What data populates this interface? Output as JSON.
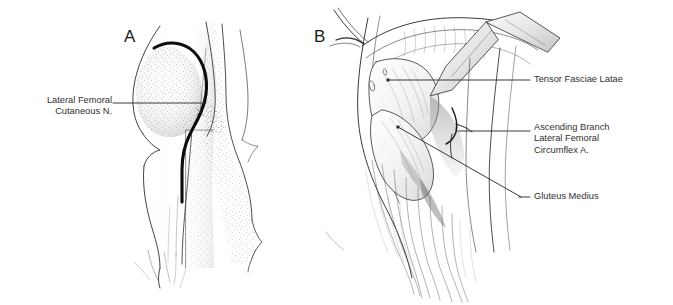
{
  "figure": {
    "type": "anatomical-illustration",
    "panel_count": 2,
    "background_color": "#ffffff",
    "ink_color": "#303030",
    "width": 673,
    "height": 305
  },
  "panels": [
    {
      "letter": "A",
      "description": "Lateral view of hip and thigh surface anatomy with stippled shading and a bold curved line marking the course of the lateral femoral cutaneous nerve / planned incision"
    },
    {
      "letter": "B",
      "description": "Close-up surgical exposure of the hip with retractors, showing the interval between tensor fasciae latae and gluteus medius and the ascending branch of the lateral femoral circumflex artery"
    }
  ],
  "labels": {
    "lateral_femoral_cutaneous_nerve": "Lateral Femoral\nCutaneous N.",
    "tensor_fasciae_latae": "Tensor Fasciae Latae",
    "ascending_branch_lfc_artery": "Ascending Branch\nLateral Femoral\nCircumflex A.",
    "gluteus_medius": "Gluteus Medius"
  },
  "leader_lines": [
    {
      "name": "lfcn-leader",
      "from": [
        113,
        103
      ],
      "to": [
        206,
        103
      ]
    },
    {
      "name": "tfl-leader",
      "from": [
        388,
        80
      ],
      "to": [
        530,
        80
      ]
    },
    {
      "name": "abla-leader",
      "from": [
        458,
        131
      ],
      "to": [
        530,
        131
      ]
    },
    {
      "name": "gmed-leader",
      "from": [
        398,
        127
      ],
      "to": [
        530,
        197
      ]
    }
  ]
}
